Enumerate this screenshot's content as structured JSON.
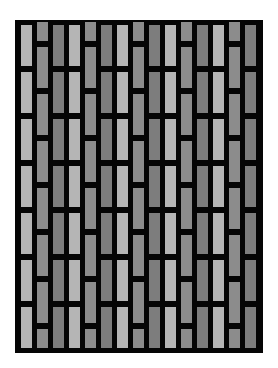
{
  "pattern": {
    "frame": {
      "x": 15,
      "y": 20,
      "width": 248,
      "height": 333,
      "color": "#050505"
    },
    "column_pitch": 16,
    "first_column_x": 21,
    "brick_width": 11,
    "colors": {
      "light": "#b5b5b5",
      "stagger": "#8c8c8c",
      "dark": "#7d7d7d"
    },
    "column_types": [
      "light",
      "stagger",
      "dark",
      "light",
      "stagger",
      "dark",
      "light",
      "stagger",
      "dark",
      "light",
      "stagger",
      "dark",
      "light",
      "stagger",
      "dark"
    ],
    "aligned_bricks": [
      [
        25,
        41
      ],
      [
        72,
        41
      ],
      [
        119,
        41
      ],
      [
        166,
        41
      ],
      [
        213,
        41
      ],
      [
        260,
        41
      ],
      [
        307,
        41
      ]
    ],
    "staggered_bricks": [
      [
        22,
        19
      ],
      [
        47,
        41
      ],
      [
        94,
        41
      ],
      [
        141,
        41
      ],
      [
        188,
        41
      ],
      [
        235,
        41
      ],
      [
        282,
        41
      ],
      [
        329,
        19
      ]
    ]
  }
}
